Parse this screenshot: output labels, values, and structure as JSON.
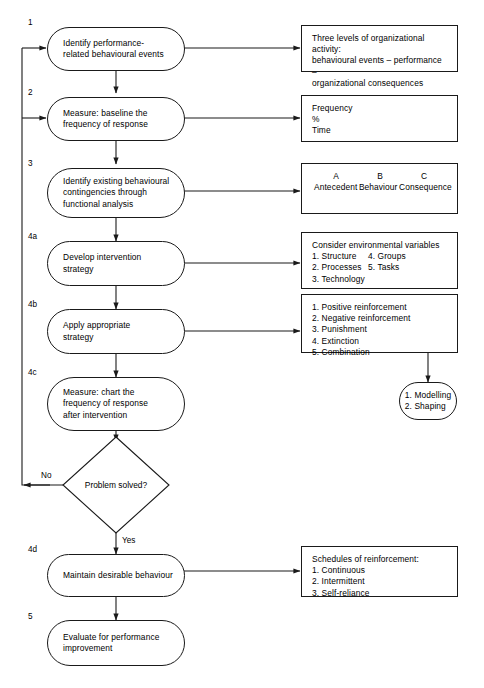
{
  "diagram": {
    "stroke_color": "#1a1a1a",
    "background": "#ffffff"
  },
  "process_steps": [
    {
      "number": "1",
      "text": "Identify performance-\nrelated behavioural events"
    },
    {
      "number": "2",
      "text": "Measure: baseline the\nfrequency of response"
    },
    {
      "number": "3",
      "text": "Identify existing behavioural\ncontingencies through\nfunctional analysis"
    },
    {
      "number": "4a",
      "text": "Develop intervention\nstrategy"
    },
    {
      "number": "4b",
      "text": "Apply appropriate\nstrategy"
    },
    {
      "number": "4c",
      "text": "Measure: chart the\nfrequency of response\nafter intervention"
    },
    {
      "number": "4d",
      "text": "Maintain desirable behaviour"
    },
    {
      "number": "5",
      "text": "Evaluate for performance\nimprovement"
    }
  ],
  "decision": {
    "text": "Problem solved?",
    "no_label": "No",
    "yes_label": "Yes"
  },
  "side_panels": [
    {
      "id": "panel-1",
      "text": "Three levels of organizational activity:\nbehavioural events – performance –\norganizational consequences"
    },
    {
      "id": "panel-2",
      "text": "Frequency\n%\nTime"
    },
    {
      "id": "panel-3",
      "abc_headers": [
        "A",
        "B",
        "C"
      ],
      "abc_terms": [
        "Antecedent",
        "Behaviour",
        "Consequence"
      ]
    },
    {
      "id": "panel-4",
      "heading": "Consider environmental variables",
      "column_left": [
        "1. Structure",
        "2. Processes",
        "3. Technology"
      ],
      "column_right": [
        "4. Groups",
        "5. Tasks"
      ]
    },
    {
      "id": "panel-5",
      "text": "1. Positive reinforcement\n2. Negative reinforcement\n3. Punishment\n4. Extinction\n5. Combination"
    },
    {
      "id": "panel-6",
      "text": "Schedules of reinforcement:\n1. Continuous\n2. Intermittent\n3. Self-reliance"
    }
  ],
  "sub_node": {
    "id": "modelling-shaping",
    "text": "1. Modelling\n2. Shaping"
  }
}
